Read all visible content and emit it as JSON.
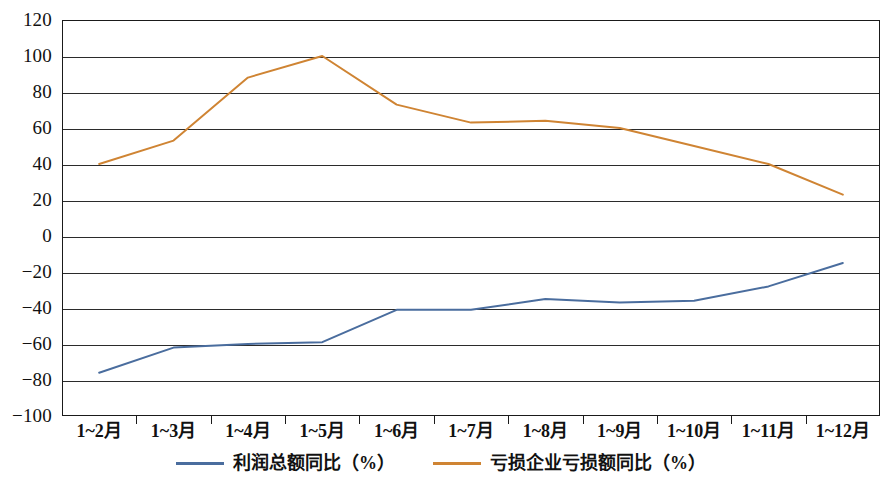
{
  "chart_data": {
    "type": "line",
    "title": "",
    "subtitle": "",
    "xlabel": "",
    "ylabel": "",
    "categories": [
      "1~2月",
      "1~3月",
      "1~4月",
      "1~5月",
      "1~6月",
      "1~7月",
      "1~8月",
      "1~9月",
      "1~10月",
      "1~11月",
      "1~12月"
    ],
    "series": [
      {
        "name": "利润总额同比（%）",
        "color": "#4a6d9e",
        "values": [
          -76,
          -62,
          -60,
          -59,
          -41,
          -41,
          -35,
          -37,
          -36,
          -28,
          -15
        ]
      },
      {
        "name": "亏损企业亏损额同比（%）",
        "color": "#cf8433",
        "values": [
          40,
          53,
          88,
          100,
          73,
          63,
          64,
          60,
          50,
          40,
          23
        ]
      }
    ],
    "ylim": [
      -100,
      120
    ],
    "ytick_step": 20,
    "yticks": [
      120,
      100,
      80,
      60,
      40,
      20,
      0,
      -20,
      -40,
      -60,
      -80,
      -100
    ],
    "ytick_labels": [
      "120",
      "100",
      "80",
      "60",
      "40",
      "20",
      "0",
      "−20",
      "−40",
      "−60",
      "−80",
      "−100"
    ],
    "grid": true,
    "grid_axis": "y",
    "legend_position": "bottom",
    "frame": true
  },
  "legend": {
    "items": [
      {
        "label": "利润总额同比（%）",
        "color": "#4a6d9e"
      },
      {
        "label": "亏损企业亏损额同比（%）",
        "color": "#cf8433"
      }
    ]
  }
}
